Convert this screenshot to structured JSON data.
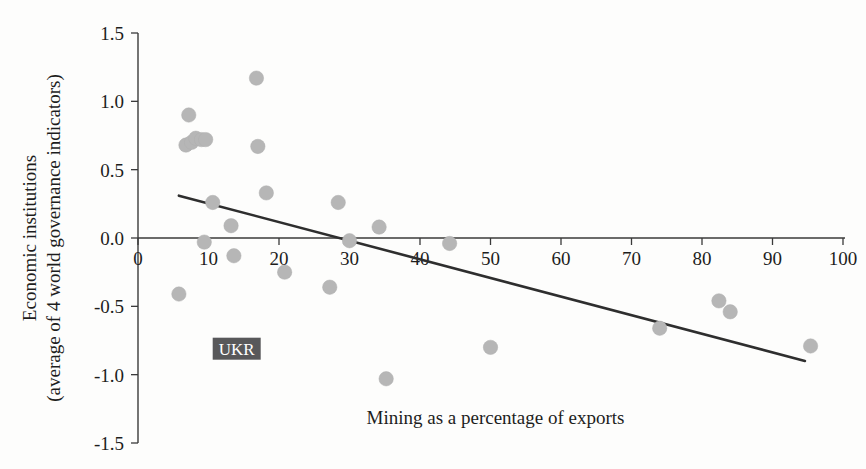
{
  "chart_data": {
    "type": "scatter",
    "title": "",
    "xlabel": "Mining as a percentage of exports",
    "ylabel_line1": "Economic institutions",
    "ylabel_line2": "(average of 4 world governance indicators)",
    "xlim": [
      0,
      100
    ],
    "ylim": [
      -1.5,
      1.5
    ],
    "xticks": [
      0,
      10,
      20,
      30,
      40,
      50,
      60,
      70,
      80,
      90,
      100
    ],
    "xtick_labels": [
      "0",
      "10",
      "20",
      "30",
      "40",
      "50",
      "60",
      "70",
      "80",
      "90",
      "100"
    ],
    "yticks": [
      -1.5,
      -1.0,
      -0.5,
      0.0,
      0.5,
      1.0,
      1.5
    ],
    "ytick_labels": [
      "-1.5",
      "-1.0",
      "-0.5",
      "0.0",
      "0.5",
      "1.0",
      "1.5"
    ],
    "grid": false,
    "legend": "none",
    "marker_color": "#b6b6b6",
    "line_color": "#2e2e2e",
    "points": [
      {
        "x": 5.8,
        "y": -0.41
      },
      {
        "x": 7.2,
        "y": 0.9
      },
      {
        "x": 6.8,
        "y": 0.68
      },
      {
        "x": 7.6,
        "y": 0.7
      },
      {
        "x": 8.2,
        "y": 0.73
      },
      {
        "x": 9.0,
        "y": 0.72
      },
      {
        "x": 9.6,
        "y": 0.72
      },
      {
        "x": 9.4,
        "y": -0.03
      },
      {
        "x": 10.6,
        "y": 0.26
      },
      {
        "x": 13.2,
        "y": 0.09
      },
      {
        "x": 13.6,
        "y": -0.13
      },
      {
        "x": 16.8,
        "y": 1.17
      },
      {
        "x": 17.0,
        "y": 0.67
      },
      {
        "x": 18.2,
        "y": 0.33
      },
      {
        "x": 20.8,
        "y": -0.25
      },
      {
        "x": 27.2,
        "y": -0.36
      },
      {
        "x": 28.4,
        "y": 0.26
      },
      {
        "x": 30.0,
        "y": -0.02
      },
      {
        "x": 34.2,
        "y": 0.08
      },
      {
        "x": 35.2,
        "y": -1.03
      },
      {
        "x": 44.2,
        "y": -0.04
      },
      {
        "x": 50.0,
        "y": -0.8
      },
      {
        "x": 74.0,
        "y": -0.66
      },
      {
        "x": 82.4,
        "y": -0.46
      },
      {
        "x": 84.0,
        "y": -0.54
      },
      {
        "x": 95.4,
        "y": -0.79
      }
    ],
    "trend_line": {
      "x0": 5.8,
      "y0": 0.31,
      "x1": 94.6,
      "y1": -0.9
    }
  },
  "annotations": [
    {
      "name": "ukr-label",
      "text": "UKR",
      "x": 14.0,
      "y": -0.81
    }
  ]
}
